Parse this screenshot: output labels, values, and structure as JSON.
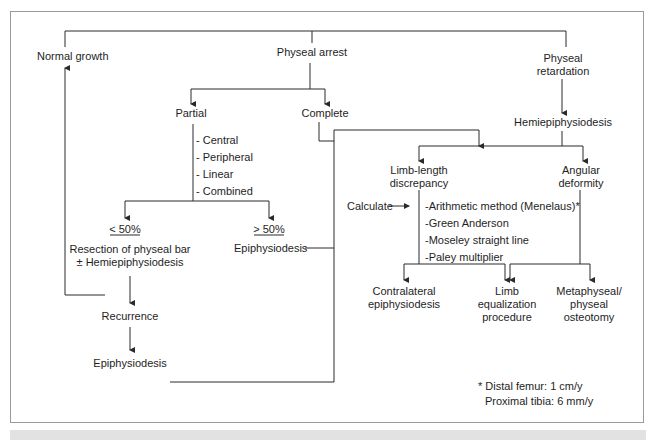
{
  "nodes": {
    "normal_growth": "Normal growth",
    "physeal_arrest": "Physeal arrest",
    "physeal_retardation_1": "Physeal",
    "physeal_retardation_2": "retardation",
    "partial": "Partial",
    "complete": "Complete",
    "hemiepiphysiodesis": "Hemiepiphysiodesis",
    "partial_types": [
      "- Central",
      "- Peripheral",
      "- Linear",
      "- Combined"
    ],
    "lt50": "< 50%",
    "gt50": "> 50%",
    "resection_1": "Resection of physeal bar",
    "resection_2": "± Hemiepiphysiodesis",
    "epiphysiodesis_gt50": "Epiphysiodesis",
    "recurrence": "Recurrence",
    "epiphysiodesis_bottom": "Epiphysiodesis",
    "lld_1": "Limb-length",
    "lld_2": "discrepancy",
    "angular_1": "Angular",
    "angular_2": "deformity",
    "calculate": "Calculate",
    "methods": [
      "-Arithmetic method (Menelaus)*",
      "-Green Anderson",
      "-Moseley straight line",
      "-Paley multiplier"
    ],
    "contralateral_1": "Contralateral",
    "contralateral_2": "epiphysiodesis",
    "limb_eq_1": "Limb",
    "limb_eq_2": "equalization",
    "limb_eq_3": "procedure",
    "metaphyseal_1": "Metaphyseal/",
    "metaphyseal_2": "physeal",
    "metaphyseal_3": "osteotomy"
  },
  "footnote": {
    "line1": "* Distal femur: 1 cm/y",
    "line2": "Proximal tibia: 6 mm/y"
  },
  "colors": {
    "line": "#2a2a2a",
    "frame": "#9a9a9a",
    "band": "#e2e2e2"
  }
}
